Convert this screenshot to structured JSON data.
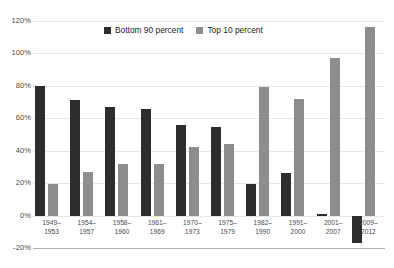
{
  "chart_data": {
    "type": "bar",
    "title": "",
    "subtitle": "",
    "xlabel": "",
    "ylabel": "",
    "ylim": [
      -20,
      120
    ],
    "ytick_step": 20,
    "grid": true,
    "legend_position": "top-center",
    "categories": [
      "1949–\n1953",
      "1954–\n1957",
      "1958–\n1960",
      "1961–\n1969",
      "1970–\n1973",
      "1975–\n1979",
      "1982–\n1990",
      "1991–\n2000",
      "2001–\n2007",
      "2009–\n2012"
    ],
    "category_lines": [
      [
        "1949–",
        "1953"
      ],
      [
        "1954–",
        "1957"
      ],
      [
        "1958–",
        "1960"
      ],
      [
        "1961–",
        "1969"
      ],
      [
        "1970–",
        "1973"
      ],
      [
        "1975–",
        "1979"
      ],
      [
        "1982–",
        "1990"
      ],
      [
        "1991–",
        "2000"
      ],
      [
        "2001–",
        "2007"
      ],
      [
        "2009–",
        "2012"
      ]
    ],
    "ytick_labels": [
      "120%",
      "100%",
      "80%",
      "60%",
      "40%",
      "20%",
      "0%",
      "-20%"
    ],
    "ytick_values": [
      120,
      100,
      80,
      60,
      40,
      20,
      0,
      -20
    ],
    "series": [
      {
        "name": "Bottom 90 percent",
        "color": "#2d2d2d",
        "values": [
          80,
          71.5,
          67,
          66,
          56,
          54.5,
          19.5,
          26,
          1,
          -17
        ]
      },
      {
        "name": "Top 10 percent",
        "color": "#8d8d8d",
        "values": [
          19.5,
          27,
          31.5,
          32,
          42,
          44,
          79.5,
          72,
          97,
          116
        ]
      }
    ]
  },
  "legend": {
    "items": [
      {
        "label": "Bottom 90 percent",
        "color": "#2d2d2d"
      },
      {
        "label": "Top 10 percent",
        "color": "#8d8d8d"
      }
    ]
  },
  "colors": {
    "background": "#ffffff",
    "gridline": "#e6e6e6",
    "axis_line": "#b0b0b0",
    "text": "#4a4a4a",
    "series_dark": "#2d2d2d",
    "series_light": "#8d8d8d"
  }
}
